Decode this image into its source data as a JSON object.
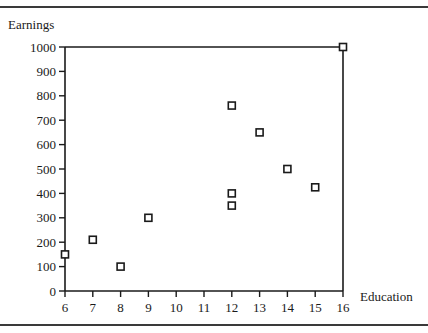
{
  "chart_data": {
    "type": "scatter",
    "title": "",
    "xlabel": "Education",
    "ylabel": "Earnings",
    "xlim": [
      6,
      16
    ],
    "ylim": [
      0,
      1000
    ],
    "x_ticks": [
      6,
      7,
      8,
      9,
      10,
      11,
      12,
      13,
      14,
      15,
      16
    ],
    "y_ticks": [
      0,
      100,
      200,
      300,
      400,
      500,
      600,
      700,
      800,
      900,
      1000
    ],
    "grid": false,
    "legend": null,
    "marker": "hollow-square",
    "series": [
      {
        "name": "Earnings vs Education",
        "points": [
          {
            "x": 6,
            "y": 150
          },
          {
            "x": 7,
            "y": 210
          },
          {
            "x": 8,
            "y": 100
          },
          {
            "x": 9,
            "y": 300
          },
          {
            "x": 12,
            "y": 760
          },
          {
            "x": 12,
            "y": 400
          },
          {
            "x": 12,
            "y": 350
          },
          {
            "x": 13,
            "y": 650
          },
          {
            "x": 14,
            "y": 500
          },
          {
            "x": 15,
            "y": 425
          },
          {
            "x": 16,
            "y": 1000
          }
        ]
      }
    ]
  },
  "colors": {
    "axis": "#1a1a1a",
    "marker": "#1a1a1a",
    "frame_rule": "#3a3a3a"
  }
}
